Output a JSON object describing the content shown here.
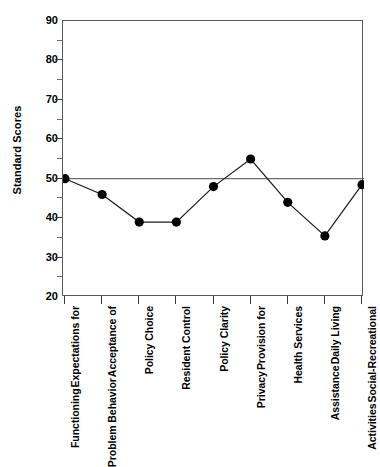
{
  "chart_data": {
    "type": "line",
    "title": "",
    "xlabel": "",
    "ylabel": "Standard Scores",
    "ylim": [
      20,
      90
    ],
    "y_major_ticks": [
      20,
      30,
      40,
      50,
      60,
      70,
      80,
      90
    ],
    "y_minor_ticks": [
      25,
      35,
      45,
      55,
      65,
      75,
      85
    ],
    "grid": false,
    "legend": null,
    "reference_line": {
      "value": 50,
      "orientation": "horizontal"
    },
    "marker": "filled-circle",
    "marker_color": "#000000",
    "line_color": "#1a1a1a",
    "categories": [
      "Expectations for Functioning",
      "Acceptance of Problem Behavior",
      "Policy Choice",
      "Resident Control",
      "Policy Clarity",
      "Provision for Privacy",
      "Health Services",
      "Daily Living Assistance",
      "Social-Recreational Activities"
    ],
    "category_lines": [
      [
        "Expectations for",
        "Functioning"
      ],
      [
        "Acceptance of",
        "Problem Behavior"
      ],
      [
        "Policy Choice"
      ],
      [
        "Resident Control"
      ],
      [
        "Policy Clarity"
      ],
      [
        "Provision for",
        "Privacy"
      ],
      [
        "Health Services"
      ],
      [
        "Daily Living",
        "Assistance"
      ],
      [
        "Social-Recreational",
        "Activities"
      ]
    ],
    "values": [
      50,
      46,
      39,
      39,
      48,
      55,
      44,
      35.5,
      48.5
    ]
  }
}
